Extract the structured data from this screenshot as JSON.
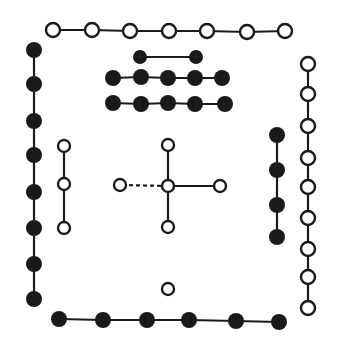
{
  "diagram": {
    "title": "",
    "style": {
      "ink": "#1a1a1a",
      "paper": "#ffffff",
      "stroke_width": 2.2
    },
    "groups": [
      {
        "name": "top-row-white-7",
        "fill": "white",
        "count": 7,
        "r": 7,
        "points": [
          [
            53,
            30
          ],
          [
            92,
            30
          ],
          [
            130,
            31
          ],
          [
            169,
            31
          ],
          [
            207,
            31
          ],
          [
            247,
            32
          ],
          [
            285,
            31
          ]
        ]
      },
      {
        "name": "left-column-black-8",
        "fill": "black",
        "count": 8,
        "r": 8,
        "points": [
          [
            34,
            50
          ],
          [
            34,
            84
          ],
          [
            34,
            121
          ],
          [
            34,
            155
          ],
          [
            34,
            192
          ],
          [
            34,
            228
          ],
          [
            34,
            264
          ],
          [
            34,
            299
          ]
        ]
      },
      {
        "name": "right-column-white-9",
        "fill": "white",
        "count": 9,
        "r": 7,
        "points": [
          [
            308,
            64
          ],
          [
            308,
            94
          ],
          [
            308,
            126
          ],
          [
            308,
            158
          ],
          [
            308,
            187
          ],
          [
            308,
            218
          ],
          [
            308,
            249
          ],
          [
            308,
            277
          ],
          [
            308,
            308
          ]
        ]
      },
      {
        "name": "bottom-row-black-6",
        "fill": "black",
        "count": 6,
        "r": 8,
        "points": [
          [
            59,
            319
          ],
          [
            103,
            320
          ],
          [
            147,
            320
          ],
          [
            189,
            320
          ],
          [
            236,
            321
          ],
          [
            279,
            322
          ]
        ]
      },
      {
        "name": "center-top-black-2",
        "fill": "black",
        "count": 2,
        "r": 7,
        "points": [
          [
            140,
            57
          ],
          [
            196,
            57
          ]
        ]
      },
      {
        "name": "center-row-black-5a",
        "fill": "black",
        "count": 5,
        "r": 8,
        "points": [
          [
            113,
            78
          ],
          [
            141,
            77
          ],
          [
            168,
            78
          ],
          [
            195,
            78
          ],
          [
            222,
            78
          ]
        ]
      },
      {
        "name": "center-row-black-5b",
        "fill": "black",
        "count": 5,
        "r": 8,
        "points": [
          [
            113,
            103
          ],
          [
            141,
            104
          ],
          [
            168,
            103
          ],
          [
            195,
            104
          ],
          [
            225,
            104
          ]
        ]
      },
      {
        "name": "inner-left-white-3",
        "fill": "white",
        "count": 3,
        "r": 6,
        "points": [
          [
            64,
            146
          ],
          [
            64,
            184
          ],
          [
            64,
            228
          ]
        ]
      },
      {
        "name": "inner-right-black-4",
        "fill": "black",
        "count": 4,
        "r": 8,
        "points": [
          [
            277,
            135
          ],
          [
            277,
            170
          ],
          [
            277,
            205
          ],
          [
            277,
            237
          ]
        ]
      },
      {
        "name": "center-cross-white-5",
        "fill": "white",
        "count": 5,
        "r": 6,
        "points": [
          [
            168,
            145
          ],
          [
            120,
            185
          ],
          [
            168,
            186
          ],
          [
            220,
            186
          ],
          [
            168,
            227
          ]
        ],
        "layout": "cross"
      },
      {
        "name": "bottom-center-white-1",
        "fill": "white",
        "count": 1,
        "r": 6,
        "points": [
          [
            168,
            289
          ]
        ]
      }
    ]
  }
}
